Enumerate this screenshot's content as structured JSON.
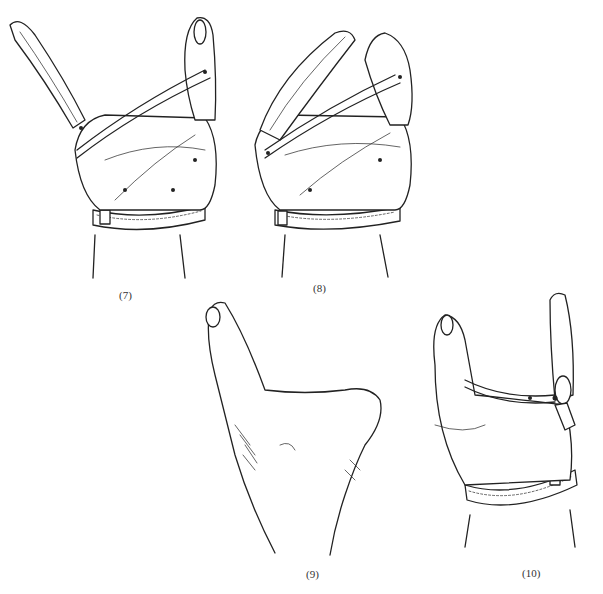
{
  "figures": [
    {
      "id": "fig7",
      "caption": "(7)",
      "subject": "hand-orthosis-lateral-view-open"
    },
    {
      "id": "fig8",
      "caption": "(8)",
      "subject": "hand-orthosis-lateral-view-closed"
    },
    {
      "id": "fig9",
      "caption": "(9)",
      "subject": "bare-hand-thumb-web-view"
    },
    {
      "id": "fig10",
      "caption": "(10)",
      "subject": "hand-orthosis-dorsal-view"
    }
  ]
}
